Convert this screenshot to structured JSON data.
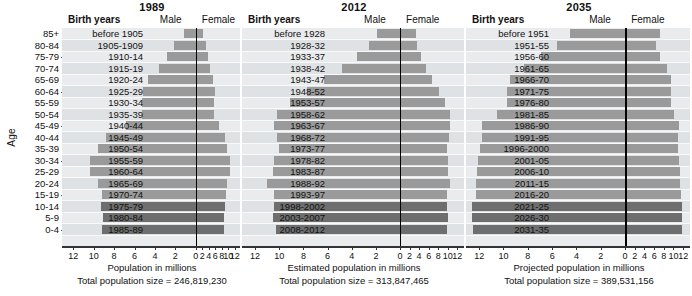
{
  "axis": {
    "age_label": "Age",
    "age_groups": [
      "85+",
      "80-84",
      "75-79",
      "70-74",
      "65-69",
      "60-64",
      "55-59",
      "50-54",
      "45-49",
      "40-44",
      "35-39",
      "30-34",
      "25-29",
      "20-24",
      "15-19",
      "10-14",
      "5-9",
      "0-4"
    ],
    "x_ticks": [
      12,
      10,
      8,
      6,
      4,
      2,
      0,
      2,
      4,
      6,
      8,
      10,
      12
    ],
    "x_max": 13.0
  },
  "header": {
    "birth_years_label": "Birth years",
    "male_label": "Male",
    "female_label": "Female"
  },
  "chart_data": {
    "type": "bar",
    "xlabel": "Population in millions",
    "ylabel": "Age",
    "xlim": [
      -13,
      13
    ],
    "grid": true,
    "legend": "none",
    "panels": [
      {
        "title": "1989",
        "caption": "Population in millions",
        "total_label": "Total population size = 246,819,230",
        "birth_years": [
          "before 1905",
          "1905-1909",
          "1910-14",
          "1915-19",
          "1920-24",
          "1925-29",
          "1930-34",
          "1935-39",
          "1940-44",
          "1945-49",
          "1950-54",
          "1955-59",
          "1960-64",
          "1965-69",
          "1970-74",
          "1975-79",
          "1980-84",
          "1985-89"
        ],
        "male": [
          1.2,
          2.1,
          2.8,
          3.6,
          4.7,
          5.2,
          5.3,
          5.3,
          6.8,
          8.8,
          9.6,
          10.4,
          10.4,
          9.6,
          9.2,
          9.3,
          9.1,
          9.2
        ],
        "female": [
          2.1,
          3.0,
          3.8,
          4.5,
          5.4,
          5.8,
          5.7,
          5.6,
          7.0,
          8.9,
          9.7,
          10.5,
          10.5,
          9.7,
          9.2,
          8.9,
          8.7,
          8.8
        ],
        "shade": [
          "light",
          "light",
          "light",
          "light",
          "light",
          "light",
          "light",
          "light",
          "light",
          "light",
          "light",
          "light",
          "light",
          "light",
          "light",
          "dark",
          "dark",
          "dark"
        ]
      },
      {
        "title": "2012",
        "caption": "Estimated population in millions",
        "total_label": "Total population size = 313,847,465",
        "birth_years": [
          "before 1928",
          "1928-32",
          "1933-37",
          "1938-42",
          "1943-47",
          "1948-52",
          "1953-57",
          "1958-62",
          "1963-67",
          "1968-72",
          "1973-77",
          "1978-82",
          "1983-87",
          "1988-92",
          "1993-97",
          "1998-2002",
          "2003-2007",
          "2008-2012"
        ],
        "male": [
          1.9,
          2.6,
          3.6,
          4.8,
          6.3,
          7.7,
          9.1,
          10.2,
          10.4,
          10.2,
          10.0,
          10.4,
          10.5,
          11.0,
          10.4,
          10.4,
          10.5,
          10.3
        ],
        "female": [
          3.4,
          3.6,
          4.4,
          5.4,
          6.8,
          8.2,
          9.4,
          10.4,
          10.5,
          10.2,
          9.8,
          10.0,
          10.1,
          10.4,
          9.9,
          9.9,
          10.0,
          9.9
        ],
        "shade": [
          "light",
          "light",
          "light",
          "light",
          "light",
          "light",
          "light",
          "light",
          "light",
          "light",
          "light",
          "light",
          "light",
          "light",
          "light",
          "dark",
          "dark",
          "dark"
        ]
      },
      {
        "title": "2035",
        "caption": "Projected population in millions",
        "total_label": "Total population size = 389,531,156",
        "birth_years": [
          "before 1951",
          "1951-55",
          "1956-60",
          "1961-65",
          "1966-70",
          "1971-75",
          "1976-80",
          "1981-85",
          "1986-90",
          "1991-95",
          "1996-2000",
          "2001-05",
          "2006-10",
          "2011-15",
          "2016-20",
          "2021-25",
          "2026-30",
          "2031-35"
        ],
        "male": [
          4.5,
          5.6,
          6.9,
          8.3,
          9.5,
          9.7,
          9.7,
          10.5,
          11.8,
          11.8,
          11.9,
          12.1,
          12.2,
          12.3,
          12.3,
          12.6,
          12.6,
          12.5
        ],
        "female": [
          7.2,
          6.3,
          7.3,
          8.7,
          9.4,
          9.4,
          9.4,
          10.1,
          11.2,
          11.0,
          10.9,
          11.2,
          11.3,
          11.4,
          11.5,
          11.7,
          11.8,
          11.7
        ],
        "shade": [
          "light",
          "light",
          "light",
          "light",
          "light",
          "light",
          "light",
          "light",
          "light",
          "light",
          "light",
          "light",
          "light",
          "light",
          "light",
          "dark",
          "dark",
          "dark"
        ]
      }
    ]
  },
  "colors": {
    "bar_light": "#9a9a9a",
    "bar_dark": "#6e6e6e",
    "plot_bg": "#e9ebed",
    "band_alt": "#dfe2e5",
    "center_line": "#000000"
  }
}
